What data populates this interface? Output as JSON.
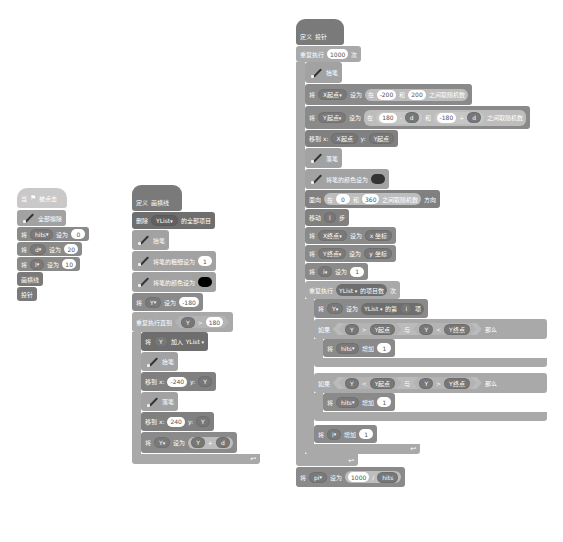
{
  "scripts": {
    "main": {
      "hat": {
        "when": "当",
        "flag_icon": "green-flag",
        "clicked": "被点击"
      },
      "clear": "全部擦除",
      "sets": [
        {
          "verb": "将",
          "var": "hits",
          "to": "设为",
          "value": "0"
        },
        {
          "verb": "将",
          "var": "d",
          "to": "设为",
          "value": "20"
        },
        {
          "verb": "将",
          "var": "l",
          "to": "设为",
          "value": "10"
        }
      ],
      "call1": "画横线",
      "call2": "投针"
    },
    "drawLines": {
      "define": "定义",
      "name": "画横线",
      "delete_all": {
        "verb": "删除",
        "list": "YList",
        "suffix": "的全部项目"
      },
      "pen_up": "抬笔",
      "set_size": {
        "label": "将笔的粗细设为",
        "value": "1"
      },
      "set_color": {
        "label": "将笔的颜色设为",
        "color": "#000000"
      },
      "set_y": {
        "verb": "将",
        "var": "Y",
        "to": "设为",
        "value": "-180"
      },
      "repeat_until": {
        "label": "重复执行直到",
        "left": "Y",
        "op": ">",
        "right": "180"
      },
      "add_to_list": {
        "verb": "将",
        "item": "Y",
        "add": "加入",
        "list": "YList"
      },
      "pen_up2": "抬笔",
      "goto1": {
        "label": "移到 x:",
        "x": "-240",
        "ylabel": "y:",
        "y": "Y"
      },
      "pen_down": "落笔",
      "goto2": {
        "label": "移到 x:",
        "x": "240",
        "ylabel": "y:",
        "y": "Y"
      },
      "set_y2": {
        "verb": "将",
        "var": "Y",
        "to": "设为",
        "left": "Y",
        "op": "+",
        "right": "d"
      }
    },
    "throwNeedle": {
      "define": "定义",
      "name": "投针",
      "repeat": {
        "label": "重复执行",
        "value": "1000",
        "suffix": "次"
      },
      "pen_up": "抬笔",
      "set_x_start": {
        "verb": "将",
        "var": "X起点",
        "to": "设为",
        "pick": "在",
        "from": "-200",
        "and": "和",
        "to2": "200",
        "suffix": "之间取随机数"
      },
      "set_y_start": {
        "verb": "将",
        "var": "Y起点",
        "to": "设为",
        "pick": "在",
        "a": "180",
        "minus": "-",
        "b": "d",
        "and": "和",
        "c": "-180",
        "plus": "+",
        "e": "d",
        "suffix": "之间取随机数"
      },
      "goto": {
        "label": "移到 x:",
        "x": "X起点",
        "ylabel": "y:",
        "y": "Y起点"
      },
      "pen_down": "落笔",
      "set_color": {
        "label": "将笔的颜色设为",
        "color": "#333333"
      },
      "point": {
        "label": "面向",
        "pick": "在",
        "from": "0",
        "and": "和",
        "to": "360",
        "suffix": "之间取随机数",
        "dir": "方向"
      },
      "move": {
        "label": "移动",
        "value": "l",
        "suffix": "步"
      },
      "set_x_end": {
        "verb": "将",
        "var": "X终点",
        "to": "设为",
        "value": "x 坐标"
      },
      "set_y_end": {
        "verb": "将",
        "var": "Y终点",
        "to": "设为",
        "value": "y 坐标"
      },
      "set_i": {
        "verb": "将",
        "var": "i",
        "to": "设为",
        "value": "1"
      },
      "repeat2": {
        "label": "重复执行",
        "list": "YList",
        "len": "的项目数",
        "suffix": "次"
      },
      "set_y_item": {
        "verb": "将",
        "var": "Y",
        "to": "设为",
        "list": "YList",
        "of": "的第",
        "idx": "i",
        "suffix": "项"
      },
      "if1": {
        "label": "如果",
        "a": "Y",
        "op1": ">",
        "b": "Y起点",
        "and": "与",
        "c": "Y",
        "op2": "<",
        "d": "Y终点",
        "then": "那么"
      },
      "inc1": {
        "verb": "将",
        "var": "hits",
        "change": "增加",
        "value": "1"
      },
      "if2": {
        "label": "如果",
        "a": "Y",
        "op1": "<",
        "b": "Y起点",
        "and": "与",
        "c": "Y",
        "op2": ">",
        "d": "Y终点",
        "then": "那么"
      },
      "inc2": {
        "verb": "将",
        "var": "hits",
        "change": "增加",
        "value": "1"
      },
      "inc_i": {
        "verb": "将",
        "var": "i",
        "change": "增加",
        "value": "1"
      },
      "set_pi": {
        "verb": "将",
        "var": "pi",
        "to": "设为",
        "a": "1000",
        "op": "/",
        "b": "hits"
      }
    }
  }
}
